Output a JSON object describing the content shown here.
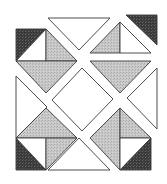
{
  "colors": {
    "background": "#ffffff",
    "white": "#ffffff",
    "gray": "#c4c4c4",
    "dark": "#3c3c3c",
    "stroke": "#3a3a3a"
  },
  "pieces": [
    {
      "name": "top-left-dark-triangle",
      "fill": "dark",
      "points": "16,29 46,29 16,61"
    },
    {
      "name": "top-left-white-triangle",
      "fill": "white",
      "points": "46,29 46,61 16,61"
    },
    {
      "name": "top-left-gray-upper-triangle",
      "fill": "gray",
      "points": "46,29 77,61 46,61"
    },
    {
      "name": "top-left-gray-lower-triangle",
      "fill": "gray",
      "points": "16,61 77,61 46,93"
    },
    {
      "name": "top-white-triangle",
      "fill": "white",
      "points": "48,18 110,18 79,50"
    },
    {
      "name": "top-right-dark-triangle",
      "fill": "dark",
      "points": "126,15 157,15 157,45"
    },
    {
      "name": "top-right-gray-half-triangle",
      "fill": "gray",
      "points": "120,22 120,53 90,53"
    },
    {
      "name": "top-right-white-half-triangle",
      "fill": "white",
      "points": "120,22 151,53 120,53"
    },
    {
      "name": "top-right-gray-inverted-triangle",
      "fill": "gray",
      "points": "90,61 151,61 120,93"
    },
    {
      "name": "left-white-triangle",
      "fill": "white",
      "points": "16,76 16,138 47,107"
    },
    {
      "name": "center-white-diamond",
      "fill": "white",
      "points": "82,68 113,99 82,131 52,100"
    },
    {
      "name": "right-white-triangle",
      "fill": "white",
      "points": "157,68 157,129 127,98"
    },
    {
      "name": "bottom-left-gray-top-triangle",
      "fill": "gray",
      "points": "46,108 77,138 16,138"
    },
    {
      "name": "bottom-left-dark-triangle",
      "fill": "dark",
      "points": "16,138 46,170 16,170"
    },
    {
      "name": "bottom-left-white-triangle",
      "fill": "white",
      "points": "16,138 46,138 46,170"
    },
    {
      "name": "bottom-left-gray-side-triangle",
      "fill": "gray",
      "points": "46,138 77,138 46,170"
    },
    {
      "name": "bottom-white-triangle",
      "fill": "white",
      "points": "79,138 110,170 48,170"
    },
    {
      "name": "bottom-right-gray-left-triangle",
      "fill": "gray",
      "points": "120,108 120,170 90,138"
    },
    {
      "name": "bottom-right-gray-top-triangle",
      "fill": "gray",
      "points": "120,108 151,138 120,138"
    },
    {
      "name": "bottom-right-white-triangle",
      "fill": "white",
      "points": "120,138 151,138 120,170"
    },
    {
      "name": "bottom-right-dark-triangle",
      "fill": "dark",
      "points": "151,138 151,170 120,170"
    }
  ]
}
